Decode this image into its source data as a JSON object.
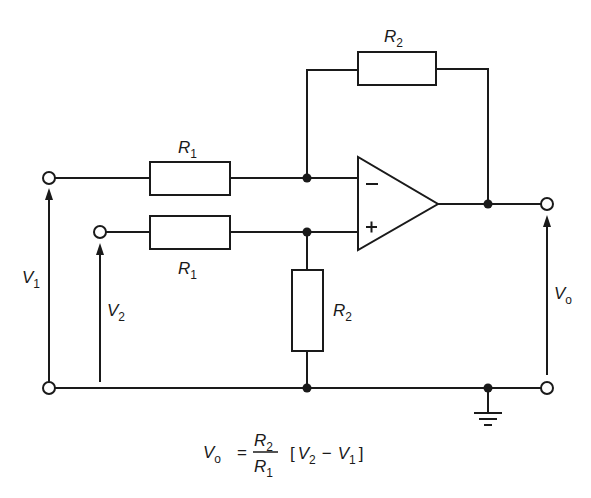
{
  "diagram": {
    "type": "circuit-schematic",
    "components": {
      "feedback_resistor": {
        "symbol": "R",
        "subscript": "2"
      },
      "input_resistor_inverting": {
        "symbol": "R",
        "subscript": "1"
      },
      "input_resistor_noninverting": {
        "symbol": "R",
        "subscript": "1"
      },
      "ground_resistor": {
        "symbol": "R",
        "subscript": "2"
      },
      "opamp": {
        "inverting_label": "−",
        "noninverting_label": "+"
      }
    },
    "voltages": {
      "v1": {
        "symbol": "V",
        "subscript": "1"
      },
      "v2": {
        "symbol": "V",
        "subscript": "2"
      },
      "vo": {
        "symbol": "V",
        "subscript": "o"
      }
    },
    "formula": {
      "lhs_symbol": "V",
      "lhs_subscript": "o",
      "equals": "=",
      "numerator_symbol": "R",
      "numerator_subscript": "2",
      "denominator_symbol": "R",
      "denominator_subscript": "1",
      "open_bracket": "[",
      "term1_symbol": "V",
      "term1_subscript": "2",
      "minus": "−",
      "term2_symbol": "V",
      "term2_subscript": "1",
      "close_bracket": "]"
    },
    "colors": {
      "ink": "#1a1a1a",
      "background": "#ffffff"
    }
  }
}
